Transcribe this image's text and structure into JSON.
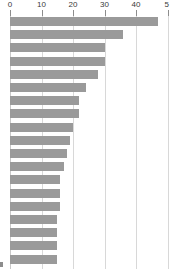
{
  "chart_data": {
    "type": "bar",
    "orientation": "horizontal",
    "title": "",
    "subtitle": "",
    "xlabel": "",
    "ylabel": "",
    "xlim": [
      0,
      50
    ],
    "ylim": null,
    "grid": true,
    "grid_axis": "x",
    "legend": false,
    "legend_position": "none",
    "axis_position": "top",
    "bar_color": "#9a9a9a",
    "gridline_color": "#d8d8d8",
    "background_color": "#ffffff",
    "tick_label_color": "#3a3a3a",
    "x_ticks": [
      0,
      10,
      20,
      30,
      40,
      50
    ],
    "x_tick_labels": [
      "0",
      "10",
      "20",
      "30",
      "40",
      "5"
    ],
    "x_tick_label_note": "rightmost label 50 is clipped by the image edge and renders as 5",
    "categories": [
      "bar-1",
      "bar-2",
      "bar-3",
      "bar-4",
      "bar-5",
      "bar-6",
      "bar-7",
      "bar-8",
      "bar-9",
      "bar-10",
      "bar-11",
      "bar-12",
      "bar-13",
      "bar-14",
      "bar-15",
      "bar-16",
      "bar-17",
      "bar-18",
      "bar-19"
    ],
    "category_labels_visible": false,
    "values": [
      47,
      36,
      30,
      30,
      28,
      24,
      22,
      22,
      20,
      19,
      18,
      17,
      16,
      16,
      16,
      15,
      15,
      15,
      15
    ],
    "bar_count": 19
  }
}
